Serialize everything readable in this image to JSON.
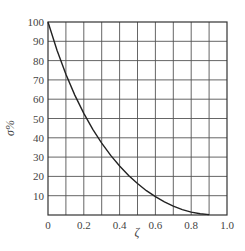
{
  "chart_data": {
    "type": "line",
    "title": "",
    "xlabel": "ζ",
    "ylabel": "σ%",
    "xlim": [
      0,
      1.0
    ],
    "ylim": [
      0,
      100
    ],
    "grid": true,
    "x_ticks": [
      "0",
      "0.2",
      "0.4",
      "0.6",
      "0.8",
      "1.0"
    ],
    "x_tick_values": [
      0,
      0.2,
      0.4,
      0.6,
      0.8,
      1.0
    ],
    "y_ticks": [
      "10",
      "20",
      "30",
      "40",
      "50",
      "60",
      "70",
      "80",
      "90",
      "100"
    ],
    "y_tick_values": [
      10,
      20,
      30,
      40,
      50,
      60,
      70,
      80,
      90,
      100
    ],
    "x_grid_step": 0.1,
    "y_grid_step": 10,
    "series": [
      {
        "name": "overshoot",
        "x": [
          0,
          0.05,
          0.1,
          0.15,
          0.2,
          0.25,
          0.3,
          0.35,
          0.4,
          0.45,
          0.5,
          0.55,
          0.6,
          0.65,
          0.7,
          0.75,
          0.8,
          0.85,
          0.9
        ],
        "values": [
          100,
          85.4,
          72.9,
          62.1,
          52.7,
          44.4,
          37.2,
          30.9,
          25.4,
          20.5,
          16.3,
          12.6,
          9.5,
          6.8,
          4.6,
          2.8,
          1.5,
          0.6,
          0.2
        ]
      }
    ],
    "colors": {
      "line": "#222222",
      "grid": "#555555",
      "frame": "#333333"
    }
  }
}
